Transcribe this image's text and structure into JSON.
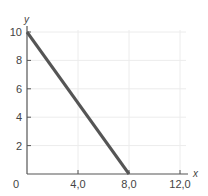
{
  "chart_data": {
    "type": "line",
    "title": "",
    "xlabel": "x",
    "ylabel": "y",
    "xlim": [
      0,
      12.0
    ],
    "ylim": [
      0,
      10
    ],
    "grid": true,
    "origin_label": "0",
    "x_ticks": [
      {
        "value": 4.0,
        "label": "4,0"
      },
      {
        "value": 8.0,
        "label": "8,0"
      },
      {
        "value": 12.0,
        "label": "12,0"
      }
    ],
    "y_ticks": [
      {
        "value": 2,
        "label": "2"
      },
      {
        "value": 4,
        "label": "4"
      },
      {
        "value": 6,
        "label": "6"
      },
      {
        "value": 8,
        "label": "8"
      },
      {
        "value": 10,
        "label": "10"
      }
    ],
    "series": [
      {
        "name": "line",
        "color": "#555555",
        "points": [
          [
            0,
            10
          ],
          [
            8.0,
            0
          ]
        ]
      }
    ]
  }
}
